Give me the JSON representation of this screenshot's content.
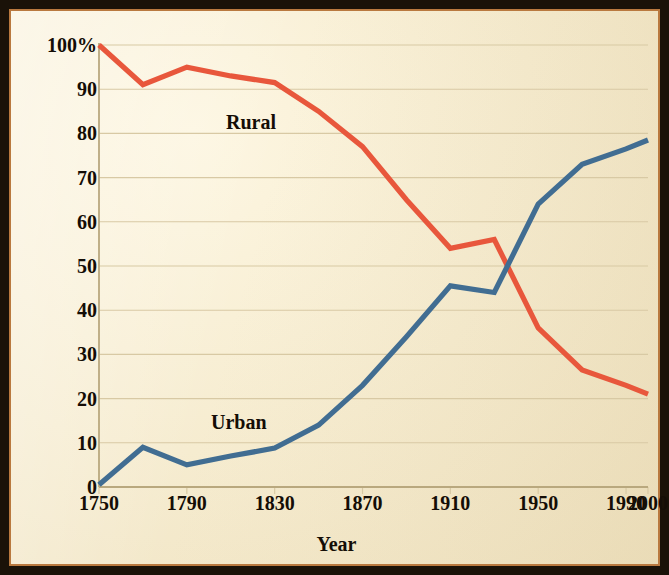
{
  "figure": {
    "frame_color": "#1a1208",
    "inner_border_color": "#b9793f",
    "paper_color": "#f6ecd0",
    "gridline_color": "#d8c9a4",
    "axis_color": "#b9a87e"
  },
  "chart_data": {
    "type": "line",
    "title": "",
    "subtitle": "",
    "xlabel": "Year",
    "ylabel": "",
    "grid": true,
    "legend_position": "inline-annotations",
    "xlim": [
      1750,
      2000
    ],
    "ylim": [
      0,
      100
    ],
    "ytick_labels": [
      "100%",
      "90",
      "80",
      "70",
      "60",
      "50",
      "40",
      "30",
      "20",
      "10",
      "0"
    ],
    "ytick_values": [
      100,
      90,
      80,
      70,
      60,
      50,
      40,
      30,
      20,
      10,
      0
    ],
    "xtick_labels": [
      "1750",
      "1790",
      "1830",
      "1870",
      "1910",
      "1950",
      "1990",
      "2000"
    ],
    "xtick_values": [
      1750,
      1790,
      1830,
      1870,
      1910,
      1950,
      1990,
      2000
    ],
    "x": [
      1750,
      1770,
      1790,
      1810,
      1830,
      1850,
      1870,
      1890,
      1910,
      1930,
      1950,
      1970,
      1990,
      2000
    ],
    "series": [
      {
        "name": "Rural",
        "color": "#e8573c",
        "values": [
          100,
          91,
          95,
          93,
          91.5,
          85,
          77,
          65,
          54,
          56,
          36,
          26.5,
          23,
          21
        ]
      },
      {
        "name": "Urban",
        "color": "#416d92",
        "values": [
          0.5,
          9,
          5,
          7,
          8.8,
          14,
          23,
          34,
          45.5,
          44,
          64,
          73,
          76.5,
          78.5
        ]
      }
    ],
    "annotations": [
      {
        "text": "Rural",
        "x": 1815,
        "y": 84
      },
      {
        "text": "Urban",
        "x": 1810,
        "y": 17
      }
    ]
  }
}
